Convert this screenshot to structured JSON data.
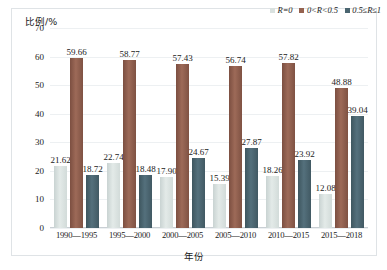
{
  "chart_data": {
    "type": "bar",
    "title": "",
    "xlabel": "年份",
    "ylabel": "比例/%",
    "ylim": [
      0,
      70
    ],
    "yticks": [
      0,
      10,
      20,
      30,
      40,
      50,
      60,
      70
    ],
    "grid": true,
    "legend_position": "top-right",
    "categories": [
      "1990—1995",
      "1995—2000",
      "2000—2005",
      "2005—2010",
      "2010—2015",
      "2015—2018"
    ],
    "series": [
      {
        "name": "R=0",
        "color": "#d9e1df",
        "values": [
          21.62,
          22.74,
          17.9,
          15.39,
          18.26,
          12.08
        ]
      },
      {
        "name": "0<R<0.5",
        "color": "#95624f",
        "values": [
          59.66,
          58.77,
          57.43,
          56.74,
          57.82,
          48.88
        ]
      },
      {
        "name": "0.5≤R≤1",
        "color": "#4a6570",
        "values": [
          18.72,
          18.48,
          24.67,
          27.87,
          23.92,
          39.04
        ]
      }
    ]
  }
}
